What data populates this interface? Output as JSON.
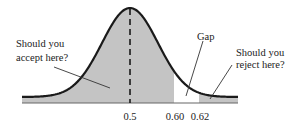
{
  "figure": {
    "type": "normal-distribution-diagram",
    "colors": {
      "curve": "#1a1a1a",
      "fill": "#c4c4c4",
      "axis": "#555555",
      "text": "#222222",
      "background": "#ffffff"
    },
    "annotations": {
      "accept_line1": "Should you",
      "accept_line2": "accept here?",
      "gap": "Gap",
      "reject_line1": "Should you",
      "reject_line2": "reject here?"
    },
    "axis_ticks": [
      {
        "label": "0.5",
        "x": 130
      },
      {
        "label": "0.60",
        "x": 175
      },
      {
        "label": "0.62",
        "x": 199
      }
    ],
    "mean_marker": "dashed vertical line at 0.5",
    "shaded_regions": [
      {
        "from": "left tail",
        "to": "0.60",
        "meaning": "accept"
      },
      {
        "from": "0.62",
        "to": "right tail",
        "meaning": "reject"
      }
    ],
    "unshaded_region": {
      "from": "0.60",
      "to": "0.62",
      "meaning": "gap"
    }
  }
}
